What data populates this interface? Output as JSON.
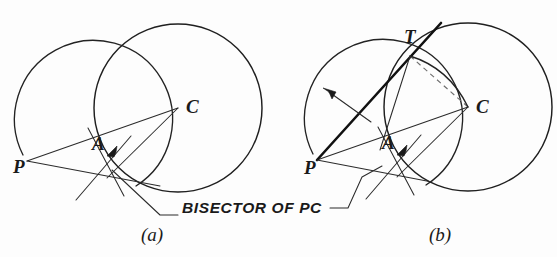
{
  "figure": {
    "background_color": "#fdfdfd",
    "line_color": "#1f1f1f",
    "construction_color": "#2b2b2b",
    "dashed_color": "#6e6e6e"
  },
  "annotations": {
    "bisector_note": "BISECTOR OF PC"
  },
  "panels": [
    {
      "key": "a",
      "caption": "(a)",
      "caption_pos": {
        "x": 152,
        "y": 241
      },
      "points": [
        {
          "name": "P",
          "label": "P",
          "x": 27,
          "y": 161,
          "label_x": 13,
          "label_y": 173
        },
        {
          "name": "A",
          "label": "A",
          "x": 104,
          "y": 152,
          "label_x": 92,
          "label_y": 150
        },
        {
          "name": "C",
          "label": "C",
          "x": 178,
          "y": 108,
          "label_x": 186,
          "label_y": 113
        }
      ],
      "main_circle": {
        "cx": 178,
        "cy": 108,
        "r": 84
      },
      "bisector_circle": {
        "cx": 102,
        "cy": 135,
        "r": 79
      }
    },
    {
      "key": "b",
      "caption": "(b)",
      "caption_pos": {
        "x": 440,
        "y": 241
      },
      "points": [
        {
          "name": "P",
          "label": "P",
          "x": 317,
          "y": 160,
          "label_x": 304,
          "label_y": 174
        },
        {
          "name": "A",
          "label": "A",
          "x": 394,
          "y": 151,
          "label_x": 382,
          "label_y": 149
        },
        {
          "name": "C",
          "label": "C",
          "x": 468,
          "y": 107,
          "label_x": 476,
          "label_y": 113
        },
        {
          "name": "T",
          "label": "T",
          "x": 410,
          "y": 56,
          "label_x": 404,
          "label_y": 43
        }
      ],
      "main_circle": {
        "cx": 468,
        "cy": 107,
        "r": 84
      },
      "bisector_circle": {
        "cx": 392,
        "cy": 134,
        "r": 79
      }
    }
  ],
  "icons": {
    "arrowhead": "arrowhead-icon",
    "tangent_line": "tangent-line",
    "radius_leader": "radius-leader-arrow"
  }
}
